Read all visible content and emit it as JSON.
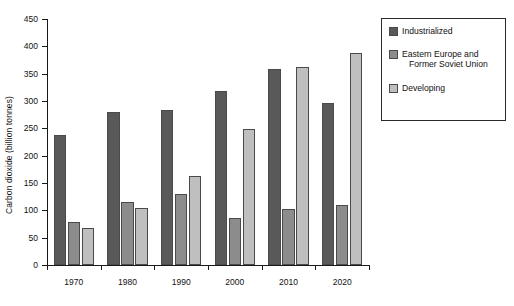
{
  "chart_data": {
    "type": "bar",
    "title": "",
    "subtitle": "",
    "xlabel": "",
    "ylabel": "Carbon dioxide (billion tonnes)",
    "categories": [
      "1970",
      "1980",
      "1990",
      "2000",
      "2010",
      "2020"
    ],
    "series": [
      {
        "name": "Industrialized",
        "color": "#595959",
        "values": [
          237,
          280,
          284,
          319,
          358,
          296
        ]
      },
      {
        "name": "Eastern Europe and Former Soviet Union",
        "color": "#8c8c8c",
        "values": [
          79,
          116,
          129,
          86,
          102,
          110
        ]
      },
      {
        "name": "Developing",
        "color": "#bfbfbf",
        "values": [
          67,
          104,
          163,
          249,
          362,
          388
        ]
      }
    ],
    "ylim": [
      0,
      450
    ],
    "ytick_step": 50,
    "yticks": [
      "0",
      "50",
      "100",
      "150",
      "200",
      "250",
      "300",
      "350",
      "400",
      "450"
    ],
    "grid": false,
    "legend_position": "right",
    "legend_entries": [
      {
        "label": "Industrialized",
        "label_lines": [
          "Industrialized"
        ],
        "color": "#595959"
      },
      {
        "label": "Eastern Europe and Former Soviet Union",
        "label_lines": [
          "Eastern Europe and",
          "Former Soviet Union"
        ],
        "color": "#8c8c8c"
      },
      {
        "label": "Developing",
        "label_lines": [
          "Developing"
        ],
        "color": "#bfbfbf"
      }
    ]
  }
}
